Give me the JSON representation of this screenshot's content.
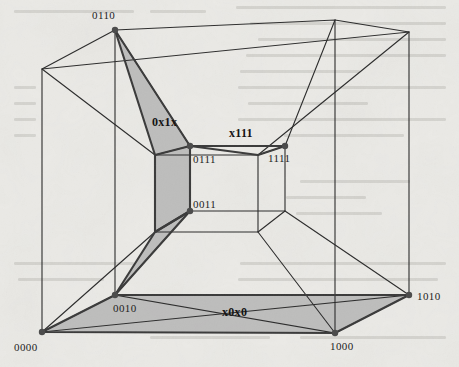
{
  "figure": {
    "width": 459,
    "height": 367,
    "background_color": "#ebeae6",
    "line_color": "#2b2b2b",
    "shade_color": "#b8b8b8",
    "vertex_color": "#555555"
  },
  "vertex_labels": [
    {
      "name": "vertex-label-0110",
      "text": "0110",
      "x": 115,
      "y": 30,
      "lx": 92,
      "ly": 19,
      "anchor": "start"
    },
    {
      "name": "vertex-label-0111",
      "text": "0111",
      "x": 190,
      "y": 146,
      "lx": 193,
      "ly": 163,
      "anchor": "start"
    },
    {
      "name": "vertex-label-1111",
      "text": "1111",
      "x": 258,
      "y": 146,
      "lx": 268,
      "ly": 162,
      "anchor": "start"
    },
    {
      "name": "vertex-label-0011",
      "text": "0011",
      "x": 190,
      "y": 211,
      "lx": 193,
      "ly": 208,
      "anchor": "start"
    },
    {
      "name": "vertex-label-0010",
      "text": "0010",
      "x": 115,
      "y": 295,
      "lx": 113,
      "ly": 312,
      "anchor": "start"
    },
    {
      "name": "vertex-label-1000",
      "text": "1000",
      "x": 335,
      "y": 333,
      "lx": 330,
      "ly": 350,
      "anchor": "start"
    },
    {
      "name": "vertex-label-1010",
      "text": "1010",
      "x": 409,
      "y": 295,
      "lx": 417,
      "ly": 300,
      "anchor": "start"
    },
    {
      "name": "vertex-label-0000",
      "text": "0000",
      "x": 42,
      "y": 332,
      "lx": 14,
      "ly": 351,
      "anchor": "start"
    }
  ],
  "face_labels": [
    {
      "name": "face-label-0x1x",
      "text": "0x1x",
      "x": 152,
      "y": 126
    },
    {
      "name": "face-label-x111",
      "text": "x111",
      "x": 229,
      "y": 137
    },
    {
      "name": "face-label-x0x0",
      "text": "x0x0",
      "x": 222,
      "y": 316
    }
  ],
  "geometry": {
    "outer_cube": {
      "front": [
        [
          42,
          332
        ],
        [
          409,
          295
        ],
        [
          409,
          32
        ],
        [
          42,
          69
        ]
      ],
      "back": [
        [
          115,
          295
        ],
        [
          335,
          333
        ],
        [
          335,
          20
        ],
        [
          115,
          30
        ]
      ]
    },
    "inner_cube": {
      "front": [
        [
          155,
          232
        ],
        [
          258,
          232
        ],
        [
          258,
          155
        ],
        [
          155,
          155
        ]
      ],
      "back": [
        [
          190,
          211
        ],
        [
          285,
          211
        ],
        [
          285,
          146
        ],
        [
          190,
          146
        ]
      ]
    },
    "shaded_regions": [
      {
        "name": "subcube-0x1x",
        "points": "115,30 190,146 190,211 115,295 155,232 155,155"
      },
      {
        "name": "subcube-x0x0",
        "points": "42,332 115,295 409,295 335,333"
      }
    ]
  }
}
